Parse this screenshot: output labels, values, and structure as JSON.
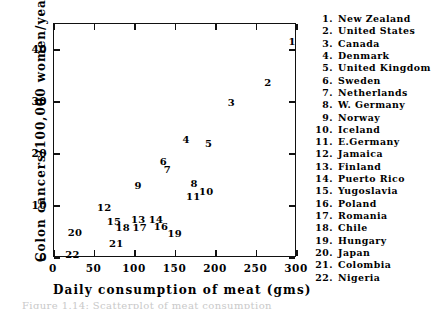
{
  "chart_data": {
    "type": "scatter",
    "title": "",
    "xlabel": "Daily consumption of meat (gms)",
    "ylabel": "Colon cancers/100,000 women/year",
    "xlim": [
      0,
      300
    ],
    "ylim": [
      0,
      45
    ],
    "xticks": [
      0,
      50,
      100,
      150,
      200,
      250,
      300
    ],
    "yticks": [
      0,
      10,
      20,
      30,
      40
    ],
    "xtick_labels": [
      "0",
      "50",
      "100",
      "150",
      "200",
      "250",
      "300"
    ],
    "ytick_labels": [
      "0",
      "10",
      "20",
      "30",
      "40"
    ],
    "grid": false,
    "legend_position": "right",
    "point_marker": "numeric-label",
    "points": [
      {
        "id": "1",
        "label": "New Zealand",
        "x": 294,
        "y": 41.5
      },
      {
        "id": "2",
        "label": "United States",
        "x": 264,
        "y": 33.7
      },
      {
        "id": "3",
        "label": "Canada",
        "x": 219,
        "y": 29.8
      },
      {
        "id": "4",
        "label": "Denmark",
        "x": 163,
        "y": 22.7
      },
      {
        "id": "5",
        "label": "United Kingdom",
        "x": 191,
        "y": 22.0
      },
      {
        "id": "6",
        "label": "Sweden",
        "x": 135,
        "y": 18.4
      },
      {
        "id": "7",
        "label": "Netherlands",
        "x": 140,
        "y": 16.9
      },
      {
        "id": "8",
        "label": "W. Germany",
        "x": 173,
        "y": 14.3
      },
      {
        "id": "9",
        "label": "Norway",
        "x": 104,
        "y": 13.9
      },
      {
        "id": "10",
        "label": "Iceland",
        "x": 188,
        "y": 12.7
      },
      {
        "id": "11",
        "label": "E.Germany",
        "x": 172,
        "y": 11.8
      },
      {
        "id": "12",
        "label": "Jamaica",
        "x": 62,
        "y": 9.6
      },
      {
        "id": "13",
        "label": "Finland",
        "x": 104,
        "y": 7.3
      },
      {
        "id": "14",
        "label": "Puerto Rico",
        "x": 126,
        "y": 7.3
      },
      {
        "id": "15",
        "label": "Yugoslavia",
        "x": 74,
        "y": 6.9
      },
      {
        "id": "16",
        "label": "Poland",
        "x": 132,
        "y": 5.9
      },
      {
        "id": "17",
        "label": "Romania",
        "x": 106,
        "y": 5.7
      },
      {
        "id": "18",
        "label": "Chile",
        "x": 85,
        "y": 5.7
      },
      {
        "id": "19",
        "label": "Hungary",
        "x": 149,
        "y": 4.7
      },
      {
        "id": "20",
        "label": "Japan",
        "x": 26,
        "y": 4.9
      },
      {
        "id": "21",
        "label": "Colombia",
        "x": 77,
        "y": 2.7
      },
      {
        "id": "22",
        "label": "Nigeria",
        "x": 23,
        "y": 0.6
      }
    ]
  },
  "legend": {
    "items": [
      {
        "num": "1.",
        "name": "New Zealand"
      },
      {
        "num": "2.",
        "name": "United States"
      },
      {
        "num": "3.",
        "name": "Canada"
      },
      {
        "num": "4.",
        "name": "Denmark"
      },
      {
        "num": "5.",
        "name": "United Kingdom"
      },
      {
        "num": "6.",
        "name": "Sweden"
      },
      {
        "num": "7.",
        "name": "Netherlands"
      },
      {
        "num": "8.",
        "name": "W. Germany"
      },
      {
        "num": "9.",
        "name": "Norway"
      },
      {
        "num": "10.",
        "name": "Iceland"
      },
      {
        "num": "11.",
        "name": "E.Germany"
      },
      {
        "num": "12.",
        "name": "Jamaica"
      },
      {
        "num": "13.",
        "name": "Finland"
      },
      {
        "num": "14.",
        "name": "Puerto Rico"
      },
      {
        "num": "15.",
        "name": "Yugoslavia"
      },
      {
        "num": "16.",
        "name": "Poland"
      },
      {
        "num": "17.",
        "name": "Romania"
      },
      {
        "num": "18.",
        "name": "Chile"
      },
      {
        "num": "19.",
        "name": "Hungary"
      },
      {
        "num": "20.",
        "name": "Japan"
      },
      {
        "num": "21.",
        "name": "Colombia"
      },
      {
        "num": "22.",
        "name": "Nigeria"
      }
    ]
  },
  "caption": "Figure 1.14: Scatterplot of meat consumption"
}
